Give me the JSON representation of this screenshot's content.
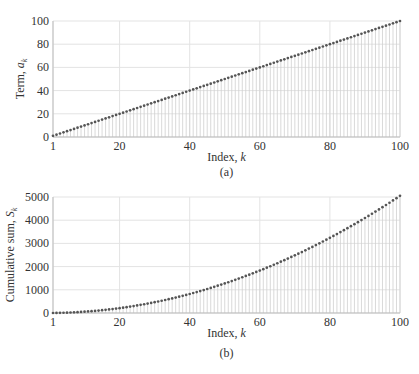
{
  "chart_data": [
    {
      "id": "a",
      "type": "scatter",
      "style": "stem",
      "caption": "(a)",
      "title": "",
      "xlabel": "Index, k",
      "ylabel": "Term, a_k",
      "ylabel_main": "Term, ",
      "ylabel_var": "a",
      "ylabel_sub": "k",
      "xlabel_main": "Index, ",
      "xlabel_var": "k",
      "formula": "a_k = k",
      "xlim": [
        1,
        100
      ],
      "ylim": [
        0,
        100
      ],
      "xticks": [
        1,
        20,
        40,
        60,
        80,
        100
      ],
      "yticks": [
        0,
        20,
        40,
        60,
        80,
        100
      ],
      "grid": true,
      "legend": null,
      "x_range": [
        1,
        100
      ],
      "values_rule": "y = k for k = 1..100",
      "sample_points": [
        [
          1,
          1
        ],
        [
          20,
          20
        ],
        [
          40,
          40
        ],
        [
          60,
          60
        ],
        [
          80,
          80
        ],
        [
          100,
          100
        ]
      ]
    },
    {
      "id": "b",
      "type": "scatter",
      "style": "stem",
      "caption": "(b)",
      "title": "",
      "xlabel": "Index, k",
      "ylabel": "Cumulative sum, S_k",
      "ylabel_main": "Cumulative sum, ",
      "ylabel_var": "S",
      "ylabel_sub": "k",
      "xlabel_main": "Index, ",
      "xlabel_var": "k",
      "formula": "S_k = k(k+1)/2",
      "xlim": [
        1,
        100
      ],
      "ylim": [
        0,
        5000
      ],
      "xticks": [
        1,
        20,
        40,
        60,
        80,
        100
      ],
      "yticks": [
        0,
        1000,
        2000,
        3000,
        4000,
        5000
      ],
      "grid": true,
      "legend": null,
      "x_range": [
        1,
        100
      ],
      "values_rule": "y = k(k+1)/2 for k = 1..100",
      "sample_points": [
        [
          1,
          1
        ],
        [
          20,
          210
        ],
        [
          40,
          820
        ],
        [
          60,
          1830
        ],
        [
          80,
          3240
        ],
        [
          100,
          5050
        ]
      ]
    }
  ],
  "colors": {
    "marker": "#555555",
    "stem": "#cfcfcf",
    "grid": "#e3e3e3",
    "axis": "#bdbdbd",
    "text": "#333333"
  }
}
